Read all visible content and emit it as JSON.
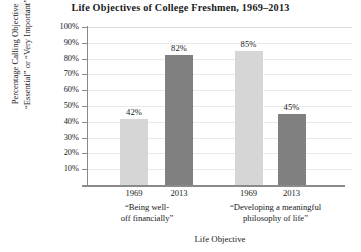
{
  "chart_data": {
    "type": "bar",
    "title": "Life Objectives of College Freshmen, 1969–2013",
    "xlabel": "Life Objective",
    "ylabel_line1": "Percentage Calling Objective",
    "ylabel_line2": "“Essential” or “Very Important”",
    "ylim": [
      0,
      100
    ],
    "ytick_labels": [
      "100%",
      "90%",
      "80%",
      "70%",
      "60%",
      "50%",
      "40%",
      "30%",
      "20%",
      "10%"
    ],
    "ytick_values": [
      100,
      90,
      80,
      70,
      60,
      50,
      40,
      30,
      20,
      10
    ],
    "grid": true,
    "legend": "none",
    "categories": [
      "1969",
      "2013",
      "1969",
      "2013"
    ],
    "groups": [
      {
        "label_line1": "“Being well-",
        "label_line2": "off financially”"
      },
      {
        "label_line1": "“Developing a meaningful",
        "label_line2": "philosophy of life”"
      }
    ],
    "bars": [
      {
        "group": 0,
        "year": "1969",
        "value": 42,
        "data_label": "42%",
        "color": "#d6d6d6"
      },
      {
        "group": 0,
        "year": "2013",
        "value": 82,
        "data_label": "82%",
        "color": "#808080"
      },
      {
        "group": 1,
        "year": "1969",
        "value": 85,
        "data_label": "85%",
        "color": "#d6d6d6"
      },
      {
        "group": 1,
        "year": "2013",
        "value": 45,
        "data_label": "45%",
        "color": "#808080"
      }
    ],
    "values": [
      42,
      82,
      85,
      45
    ],
    "colors": {
      "light_bar": "#d6d6d6",
      "dark_bar": "#808080",
      "gridline": "#e9e9e9",
      "axis": "#8a8a8a",
      "text": "#1a1a1a"
    }
  }
}
